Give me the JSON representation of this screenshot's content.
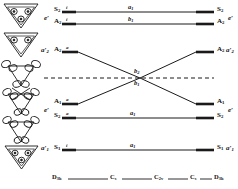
{
  "diagram": {
    "ink_color": "#1a1a1a",
    "left_point_group": "D3h",
    "right_point_group": "D3h",
    "rows": [
      {
        "id": "row1-top",
        "left_symmetry": "S",
        "left_symmetry_sub": "2",
        "left_mark": "i",
        "middle_label": "a",
        "middle_label_sub": "1",
        "right_symmetry": "S",
        "right_symmetry_sub": "2",
        "group_left": "e′",
        "group_right": "e′"
      },
      {
        "id": "row2",
        "left_symmetry": "A",
        "left_symmetry_sub": "2",
        "left_mark": "i",
        "middle_label": "b",
        "middle_label_sub": "1",
        "right_symmetry": "A",
        "right_symmetry_sub": "2",
        "group_left": "",
        "group_right": ""
      },
      {
        "id": "row3",
        "left_symmetry": "A",
        "left_symmetry_sub": "2",
        "left_mark": "a",
        "middle_label": "b",
        "middle_label_sub": "2",
        "right_symmetry": "A",
        "right_symmetry_sub": "2",
        "group_left": "a′",
        "group_left_sub": "2",
        "group_right": "a′",
        "group_right_sub": "2"
      },
      {
        "id": "row4",
        "left_symmetry": "A",
        "left_symmetry_sub": "1",
        "left_mark": "a",
        "middle_label": "b",
        "middle_label_sub": "1",
        "right_symmetry": "A",
        "right_symmetry_sub": "1",
        "group_left": "e′",
        "group_right": "e′"
      },
      {
        "id": "row5",
        "left_symmetry": "S",
        "left_symmetry_sub": "2",
        "left_mark": "a",
        "middle_label": "a",
        "middle_label_sub": "1",
        "right_symmetry": "S",
        "right_symmetry_sub": "2",
        "group_left": "",
        "group_right": ""
      },
      {
        "id": "row6-bottom",
        "left_symmetry": "S",
        "left_symmetry_sub": "1",
        "left_mark": "i",
        "middle_label": "a",
        "middle_label_sub": "1",
        "right_symmetry": "S",
        "right_symmetry_sub": "1",
        "group_left": "a′",
        "group_left_sub": "1",
        "group_right": "a′",
        "group_right_sub": "1"
      }
    ],
    "crossing_labels": {
      "upper": "b",
      "upper_sub": "2",
      "lower": "b",
      "lower_sub": "1"
    },
    "axis": {
      "items": [
        {
          "label": "D",
          "sub": "3h"
        },
        {
          "label": "C",
          "sub": "s"
        },
        {
          "label": "C",
          "sub": "2v"
        },
        {
          "label": "C",
          "sub": "s"
        },
        {
          "label": "D",
          "sub": "3h"
        }
      ]
    },
    "orbital_pictograms": [
      {
        "id": "pict-1",
        "kind": "triangle-three-lobes"
      },
      {
        "id": "pict-2",
        "kind": "triangle-two-lobes"
      },
      {
        "id": "pict-3",
        "kind": "triangle-p-orbitals-wide"
      },
      {
        "id": "pict-4",
        "kind": "triangle-p-orbitals-cross"
      },
      {
        "id": "pict-5",
        "kind": "triangle-p-orbitals-lower"
      },
      {
        "id": "pict-6",
        "kind": "triangle-three-lobes-filled"
      }
    ]
  }
}
